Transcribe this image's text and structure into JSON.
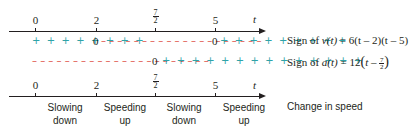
{
  "top_axis": {
    "variable": "t",
    "ticks": [
      {
        "label": "0",
        "x": 35
      },
      {
        "label": "2",
        "x": 96
      },
      {
        "label_num": "7",
        "label_den": "2",
        "x": 155
      },
      {
        "label": "5",
        "x": 215
      }
    ]
  },
  "velocity_row": {
    "segments": [
      {
        "text": "+ + + + + + + + ",
        "sign": "plus"
      },
      {
        "text": "0",
        "sign": "zero"
      },
      {
        "text": " – – – – – – – – – – – – – – – – – – – – ",
        "sign": "minus"
      },
      {
        "text": "0",
        "sign": "zero"
      },
      {
        "text": " + + + + + + + + +",
        "sign": "plus"
      }
    ],
    "label_prefix": "Sign of ",
    "label_func": "v(t)",
    "label_expr": " = 6(t – 2)(t – 5)"
  },
  "acceleration_row": {
    "minus_text": "– – – – – – – – – – – – – – – – – – – – – – ",
    "zero": "0",
    "plus_text": " + + + + + + + + + + + + + +",
    "label_prefix": "Sign of ",
    "label_func": "a(t)",
    "label_expr": " = 12",
    "label_paren_open": "(",
    "label_inner": "t – ",
    "frac_num": "7",
    "frac_den": "2",
    "label_paren_close": ")"
  },
  "bottom_axis": {
    "variable": "t",
    "ticks": [
      {
        "label": "0"
      },
      {
        "label": "2"
      },
      {
        "label_num": "7",
        "label_den": "2"
      },
      {
        "label": "5"
      }
    ]
  },
  "speed_intervals": [
    {
      "line1": "Slowing",
      "line2": "down"
    },
    {
      "line1": "Speeding",
      "line2": "up"
    },
    {
      "line1": "Slowing",
      "line2": "down"
    },
    {
      "line1": "Speeding",
      "line2": "up"
    }
  ],
  "speed_row_label": "Change in speed",
  "colors": {
    "plus": "#2fa3a8",
    "minus": "#e0544b",
    "axis": "#231f20"
  }
}
